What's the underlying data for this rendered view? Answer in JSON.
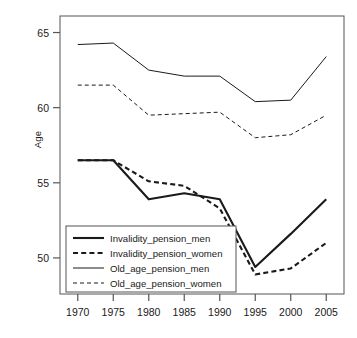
{
  "figure": {
    "background": "#ffffff",
    "line_color": "#1a1a1a"
  },
  "chart_data": {
    "type": "line",
    "title": "",
    "xlabel": "",
    "ylabel": "Age",
    "x": [
      1970,
      1975,
      1980,
      1985,
      1990,
      1995,
      2000,
      2005
    ],
    "xtick_labels": [
      "1970",
      "1975",
      "1980",
      "1985",
      "1990",
      "1995",
      "2000",
      "2005"
    ],
    "ytick_labels": [
      "65",
      "60",
      "55",
      "50"
    ],
    "yticks": [
      65,
      60,
      55,
      50
    ],
    "ylim": [
      47.6,
      66.1
    ],
    "xlim": [
      1967.5,
      2007.5
    ],
    "grid": false,
    "legend_position": "bottom-left",
    "series": [
      {
        "name": "Invalidity_pension_men",
        "style": "solid",
        "width": "thick",
        "values": [
          56.5,
          56.5,
          53.9,
          54.3,
          53.9,
          49.4,
          51.6,
          53.9
        ]
      },
      {
        "name": "Invalidity_pension_women",
        "style": "dashed",
        "width": "thick",
        "values": [
          56.5,
          56.5,
          55.1,
          54.8,
          53.3,
          48.9,
          49.3,
          51.0
        ]
      },
      {
        "name": "Old_age_pension_men",
        "style": "solid",
        "width": "thin",
        "values": [
          64.2,
          64.3,
          62.5,
          62.1,
          62.1,
          60.4,
          60.5,
          63.4
        ]
      },
      {
        "name": "Old_age_pension_women",
        "style": "dashed",
        "width": "thin",
        "values": [
          61.5,
          61.5,
          59.5,
          59.6,
          59.7,
          58.0,
          58.2,
          59.5
        ]
      }
    ]
  },
  "legend": {
    "entries": [
      "Invalidity_pension_men",
      "Invalidity_pension_women",
      "Old_age_pension_men",
      "Old_age_pension_women"
    ]
  }
}
